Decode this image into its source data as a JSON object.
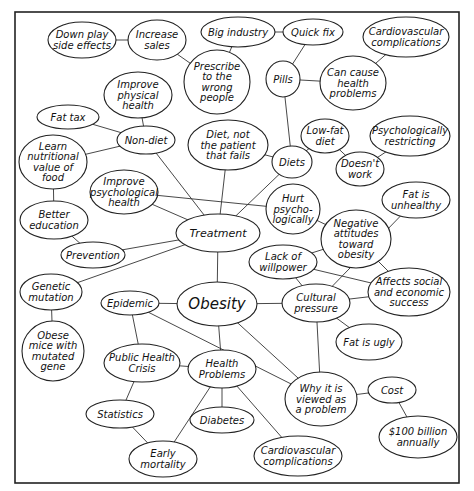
{
  "diagram": {
    "frame": {
      "x": 15,
      "y": 12,
      "w": 444,
      "h": 471
    },
    "nodes": [
      {
        "id": "obesity",
        "lines": [
          "Obesity"
        ],
        "cx": 217,
        "cy": 304,
        "rx": 40,
        "ry": 22,
        "size": "big"
      },
      {
        "id": "treatment",
        "lines": [
          "Treatment"
        ],
        "cx": 218,
        "cy": 233,
        "rx": 42,
        "ry": 19,
        "size": "mid"
      },
      {
        "id": "down-play",
        "lines": [
          "Down play",
          "side effects"
        ],
        "cx": 82,
        "cy": 40,
        "rx": 34,
        "ry": 18
      },
      {
        "id": "increase-sales",
        "lines": [
          "Increase",
          "sales"
        ],
        "cx": 157,
        "cy": 40,
        "rx": 29,
        "ry": 20
      },
      {
        "id": "big-industry",
        "lines": [
          "Big industry"
        ],
        "cx": 238,
        "cy": 32,
        "rx": 37,
        "ry": 15
      },
      {
        "id": "quick-fix",
        "lines": [
          "Quick fix"
        ],
        "cx": 313,
        "cy": 32,
        "rx": 30,
        "ry": 13
      },
      {
        "id": "cardio-top",
        "lines": [
          "Cardiovascular",
          "complications"
        ],
        "cx": 406,
        "cy": 37,
        "rx": 43,
        "ry": 20
      },
      {
        "id": "prescribe",
        "lines": [
          "Prescribe",
          "to the",
          "wrong",
          "people"
        ],
        "cx": 217,
        "cy": 82,
        "rx": 33,
        "ry": 32
      },
      {
        "id": "pills",
        "lines": [
          "Pills"
        ],
        "cx": 283,
        "cy": 79,
        "rx": 17,
        "ry": 18
      },
      {
        "id": "can-cause",
        "lines": [
          "Can cause",
          "health",
          "problems"
        ],
        "cx": 353,
        "cy": 83,
        "rx": 33,
        "ry": 27
      },
      {
        "id": "improve-physical",
        "lines": [
          "Improve",
          "physical",
          "health"
        ],
        "cx": 138,
        "cy": 95,
        "rx": 34,
        "ry": 23
      },
      {
        "id": "fat-tax",
        "lines": [
          "Fat tax"
        ],
        "cx": 68,
        "cy": 117,
        "rx": 31,
        "ry": 12
      },
      {
        "id": "non-diet",
        "lines": [
          "Non-diet"
        ],
        "cx": 146,
        "cy": 140,
        "rx": 29,
        "ry": 14
      },
      {
        "id": "diet-not-patient",
        "lines": [
          "Diet, not",
          "the patient",
          "that fails"
        ],
        "cx": 228,
        "cy": 145,
        "rx": 40,
        "ry": 25
      },
      {
        "id": "low-fat",
        "lines": [
          "Low-fat",
          "diet"
        ],
        "cx": 325,
        "cy": 136,
        "rx": 24,
        "ry": 17
      },
      {
        "id": "psych-restricting",
        "lines": [
          "Psychologically",
          "restricting"
        ],
        "cx": 410,
        "cy": 136,
        "rx": 40,
        "ry": 20
      },
      {
        "id": "diets",
        "lines": [
          "Diets"
        ],
        "cx": 292,
        "cy": 162,
        "rx": 20,
        "ry": 16
      },
      {
        "id": "learn-nutritional",
        "lines": [
          "Learn",
          "nutritional",
          "value of",
          "food"
        ],
        "cx": 53,
        "cy": 162,
        "rx": 34,
        "ry": 27
      },
      {
        "id": "doesnt-work",
        "lines": [
          "Doesn't",
          "work"
        ],
        "cx": 360,
        "cy": 169,
        "rx": 24,
        "ry": 17
      },
      {
        "id": "improve-psych",
        "lines": [
          "Improve",
          "psychological",
          "health"
        ],
        "cx": 124,
        "cy": 192,
        "rx": 34,
        "ry": 22
      },
      {
        "id": "fat-unhealthy",
        "lines": [
          "Fat is",
          "unhealthy"
        ],
        "cx": 416,
        "cy": 200,
        "rx": 34,
        "ry": 18
      },
      {
        "id": "hurt-psych",
        "lines": [
          "Hurt",
          "psycho-",
          "logically"
        ],
        "cx": 293,
        "cy": 209,
        "rx": 27,
        "ry": 25
      },
      {
        "id": "better-education",
        "lines": [
          "Better",
          "education"
        ],
        "cx": 54,
        "cy": 220,
        "rx": 34,
        "ry": 19
      },
      {
        "id": "negative-attitudes",
        "lines": [
          "Negative",
          "attitudes",
          "toward",
          "obesity"
        ],
        "cx": 356,
        "cy": 239,
        "rx": 35,
        "ry": 29
      },
      {
        "id": "prevention",
        "lines": [
          "Prevention"
        ],
        "cx": 93,
        "cy": 255,
        "rx": 32,
        "ry": 13
      },
      {
        "id": "lack-willpower",
        "lines": [
          "Lack of",
          "willpower"
        ],
        "cx": 283,
        "cy": 262,
        "rx": 34,
        "ry": 17
      },
      {
        "id": "genetic-mutation",
        "lines": [
          "Genetic",
          "mutation"
        ],
        "cx": 51,
        "cy": 292,
        "rx": 31,
        "ry": 18
      },
      {
        "id": "epidemic",
        "lines": [
          "Epidemic"
        ],
        "cx": 130,
        "cy": 303,
        "rx": 29,
        "ry": 12
      },
      {
        "id": "cultural-pressure",
        "lines": [
          "Cultural",
          "pressure"
        ],
        "cx": 316,
        "cy": 303,
        "rx": 34,
        "ry": 19
      },
      {
        "id": "affects-social",
        "lines": [
          "Affects social",
          "and economic",
          "success"
        ],
        "cx": 409,
        "cy": 292,
        "rx": 41,
        "ry": 24
      },
      {
        "id": "obese-mice",
        "lines": [
          "Obese",
          "mice with",
          "mutated",
          "gene"
        ],
        "cx": 53,
        "cy": 351,
        "rx": 31,
        "ry": 30
      },
      {
        "id": "fat-ugly",
        "lines": [
          "Fat is ugly"
        ],
        "cx": 369,
        "cy": 342,
        "rx": 33,
        "ry": 18
      },
      {
        "id": "public-health",
        "lines": [
          "Public Health",
          "Crisis"
        ],
        "cx": 142,
        "cy": 363,
        "rx": 38,
        "ry": 19
      },
      {
        "id": "health-problems",
        "lines": [
          "Health",
          "Problems"
        ],
        "cx": 222,
        "cy": 369,
        "rx": 34,
        "ry": 19
      },
      {
        "id": "why-problem",
        "lines": [
          "Why it is",
          "viewed as",
          "a problem"
        ],
        "cx": 321,
        "cy": 399,
        "rx": 36,
        "ry": 27
      },
      {
        "id": "cost",
        "lines": [
          "Cost"
        ],
        "cx": 392,
        "cy": 390,
        "rx": 24,
        "ry": 13
      },
      {
        "id": "statistics",
        "lines": [
          "Statistics"
        ],
        "cx": 120,
        "cy": 414,
        "rx": 34,
        "ry": 14
      },
      {
        "id": "diabetes",
        "lines": [
          "Diabetes"
        ],
        "cx": 222,
        "cy": 420,
        "rx": 32,
        "ry": 13
      },
      {
        "id": "early-mortality",
        "lines": [
          "Early",
          "mortality"
        ],
        "cx": 163,
        "cy": 459,
        "rx": 34,
        "ry": 18
      },
      {
        "id": "hundred-billion",
        "lines": [
          "$100 billion",
          "annually"
        ],
        "cx": 418,
        "cy": 437,
        "rx": 39,
        "ry": 21
      },
      {
        "id": "cardio-bottom",
        "lines": [
          "Cardiovascular",
          "complications"
        ],
        "cx": 298,
        "cy": 456,
        "rx": 44,
        "ry": 20
      }
    ],
    "edges": [
      [
        "down-play",
        "increase-sales"
      ],
      [
        "increase-sales",
        "prescribe"
      ],
      [
        "prescribe",
        "big-industry"
      ],
      [
        "big-industry",
        "quick-fix"
      ],
      [
        "quick-fix",
        "pills"
      ],
      [
        "pills",
        "can-cause"
      ],
      [
        "can-cause",
        "cardio-top"
      ],
      [
        "pills",
        "diets"
      ],
      [
        "improve-physical",
        "non-diet"
      ],
      [
        "fat-tax",
        "non-diet"
      ],
      [
        "non-diet",
        "learn-nutritional"
      ],
      [
        "non-diet",
        "treatment"
      ],
      [
        "learn-nutritional",
        "better-education"
      ],
      [
        "better-education",
        "prevention"
      ],
      [
        "prevention",
        "treatment"
      ],
      [
        "genetic-mutation",
        "treatment"
      ],
      [
        "genetic-mutation",
        "obese-mice"
      ],
      [
        "improve-psych",
        "treatment"
      ],
      [
        "improve-psych",
        "hurt-psych"
      ],
      [
        "diet-not-patient",
        "treatment"
      ],
      [
        "diet-not-patient",
        "diets"
      ],
      [
        "diets",
        "treatment"
      ],
      [
        "diets",
        "low-fat"
      ],
      [
        "low-fat",
        "doesnt-work"
      ],
      [
        "doesnt-work",
        "psych-restricting"
      ],
      [
        "hurt-psych",
        "negative-attitudes"
      ],
      [
        "treatment",
        "obesity"
      ],
      [
        "obesity",
        "epidemic"
      ],
      [
        "obesity",
        "cultural-pressure"
      ],
      [
        "obesity",
        "health-problems"
      ],
      [
        "obesity",
        "why-problem"
      ],
      [
        "epidemic",
        "public-health"
      ],
      [
        "epidemic",
        "why-problem"
      ],
      [
        "public-health",
        "health-problems"
      ],
      [
        "public-health",
        "statistics"
      ],
      [
        "statistics",
        "early-mortality"
      ],
      [
        "health-problems",
        "early-mortality"
      ],
      [
        "health-problems",
        "diabetes"
      ],
      [
        "health-problems",
        "cardio-bottom"
      ],
      [
        "lack-willpower",
        "cultural-pressure"
      ],
      [
        "lack-willpower",
        "negative-attitudes"
      ],
      [
        "lack-willpower",
        "affects-social"
      ],
      [
        "negative-attitudes",
        "affects-social"
      ],
      [
        "fat-unhealthy",
        "cultural-pressure"
      ],
      [
        "cultural-pressure",
        "affects-social"
      ],
      [
        "cultural-pressure",
        "fat-ugly"
      ],
      [
        "cultural-pressure",
        "why-problem"
      ],
      [
        "why-problem",
        "cost"
      ],
      [
        "cost",
        "hundred-billion"
      ]
    ]
  }
}
